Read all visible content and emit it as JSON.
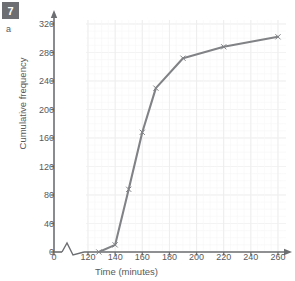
{
  "badge": {
    "number": "7",
    "part": "a"
  },
  "chart_data": {
    "type": "line",
    "title": "",
    "xlabel": "Time (minutes)",
    "ylabel": "Cumulative frequency",
    "x": [
      128,
      140,
      150,
      160,
      170,
      190,
      220,
      260
    ],
    "values": [
      0,
      10,
      88,
      168,
      230,
      272,
      288,
      302
    ],
    "xlim": [
      120,
      265
    ],
    "ylim": [
      0,
      325
    ],
    "xticks": [
      0,
      120,
      140,
      160,
      180,
      200,
      220,
      240,
      260
    ],
    "xtick_labels": [
      "0",
      "120",
      "140",
      "160",
      "180",
      "200",
      "220",
      "240",
      "260"
    ],
    "yticks": [
      0,
      40,
      80,
      120,
      160,
      200,
      240,
      280,
      320
    ],
    "ytick_labels": [
      "0",
      "40",
      "80",
      "120",
      "160",
      "200",
      "240",
      "280",
      "320"
    ],
    "grid": true,
    "legend": "none",
    "axis_break": true,
    "marker": "cross",
    "line_color": "#808285",
    "grid_color": "#ededee",
    "axis_color": "#6d6e71"
  }
}
